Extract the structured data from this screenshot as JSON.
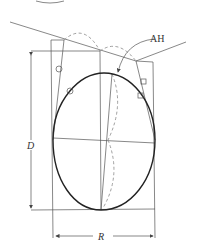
{
  "diagram": {
    "top_label_partial": "( )",
    "labels": {
      "ah": "AH",
      "d": "D",
      "r": "R"
    },
    "colors": {
      "line": "#555555",
      "outline": "#222222",
      "dashed": "#888888"
    }
  }
}
